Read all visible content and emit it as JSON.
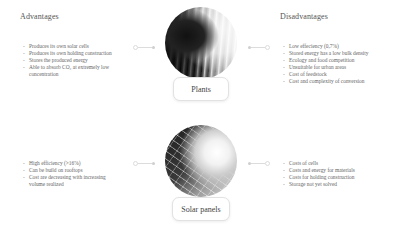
{
  "headings": {
    "advantages": "Advantages",
    "disadvantages": "Disadvantages"
  },
  "plants": {
    "label": "Plants",
    "image": "forest-photo",
    "advantages": [
      "Produces its own solar cells",
      "Produces its own holding construction",
      "Stores the produced energy",
      "Able to absorb CO₂ at extremely low concentration"
    ],
    "disadvantages": [
      "Low effeciency (0,7%)",
      "Stored energy has a low bulk density",
      "Ecology and food competition",
      "Unsuitable for urban areas",
      "Cost of feedstock",
      "Cost and complexity of conversion"
    ]
  },
  "solar_panels": {
    "label": "Solar panels",
    "image": "solar-panel-photo",
    "advantages": [
      "High efficiency (>16%)",
      "Can be build on rooftops",
      "Cost are decreasing with increasing volume realized"
    ],
    "disadvantages": [
      "Costs of cells",
      "Costs and energy for materials",
      "Costs for holding construction",
      "Storage not yet solved"
    ]
  },
  "colors": {
    "background": "#ffffff",
    "text": "#666666",
    "connector": "#dcdcdc"
  }
}
